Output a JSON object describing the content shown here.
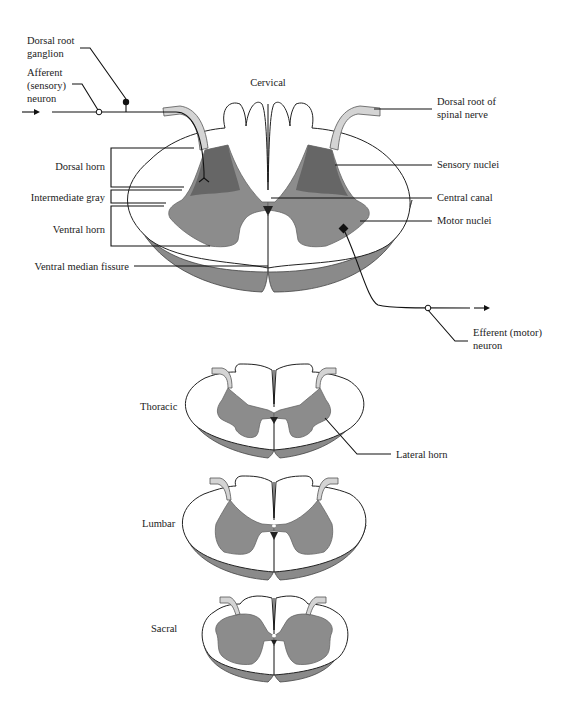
{
  "figure": {
    "sections": [
      {
        "id": "cervical",
        "label": "Cervical"
      },
      {
        "id": "thoracic",
        "label": "Thoracic"
      },
      {
        "id": "lumbar",
        "label": "Lumbar"
      },
      {
        "id": "sacral",
        "label": "Sacral"
      }
    ],
    "labels": {
      "dorsal_root_ganglion": [
        "Dorsal root",
        "ganglion"
      ],
      "afferent_neuron": [
        "Afferent",
        "(sensory)",
        "neuron"
      ],
      "dorsal_horn": "Dorsal horn",
      "intermediate_gray": "Intermediate gray",
      "ventral_horn": "Ventral horn",
      "ventral_median_fissure": "Ventral median fissure",
      "dorsal_root_of_spinal_nerve": [
        "Dorsal root of",
        "spinal nerve"
      ],
      "sensory_nuclei": "Sensory nuclei",
      "central_canal": "Central canal",
      "motor_nuclei": "Motor nuclei",
      "efferent_neuron": [
        "Efferent (motor)",
        "neuron"
      ],
      "lateral_horn": "Lateral horn"
    },
    "colors": {
      "white_matter": "#ffffff",
      "gray_matter": "#8c8c8c",
      "sensory_region": "#666666",
      "rim_shading": "#8a8a8a",
      "nerve_root": "#d4d4d4",
      "leader_line": "#111111"
    }
  }
}
